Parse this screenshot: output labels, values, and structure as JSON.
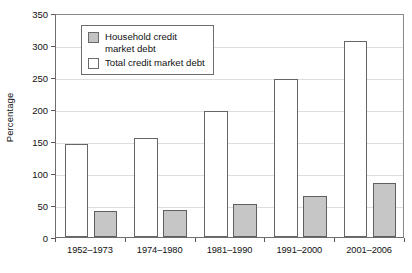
{
  "chart_data": {
    "type": "bar",
    "title": "",
    "subtitle": "",
    "xlabel": "",
    "ylabel": "Percentage",
    "categories": [
      "1952–1973",
      "1974–1980",
      "1981–1990",
      "1991–2000",
      "2001–2006"
    ],
    "series": [
      {
        "name": "Total credit market debt",
        "values": [
          145,
          155,
          197,
          247,
          306
        ],
        "color": "#ffffff",
        "edge_color": "#666666"
      },
      {
        "name": "Household credit market debt",
        "values": [
          40,
          43,
          52,
          64,
          84
        ],
        "color": "#c6c6c6",
        "edge_color": "#5f5f5f"
      }
    ],
    "ylim": [
      0,
      350
    ],
    "ytick_values": [
      0,
      50,
      100,
      150,
      200,
      250,
      300,
      350
    ],
    "ytick_labels": [
      "0",
      "50",
      "100",
      "150",
      "200",
      "250",
      "300",
      "350"
    ],
    "grid": true,
    "grid_color": "#dedede",
    "legend_position": "upper left",
    "legend_entries": [
      {
        "label": "Household credit\nmarket debt",
        "swatch": "house"
      },
      {
        "label": "Total credit market debt",
        "swatch": "total"
      }
    ]
  }
}
